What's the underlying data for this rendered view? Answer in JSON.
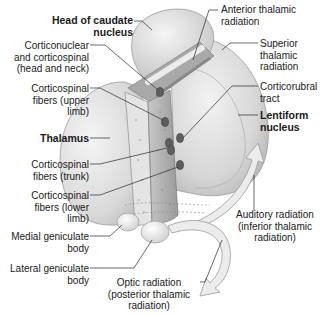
{
  "figure": {
    "labels": {
      "head_of_caudate": [
        "Head of caudate",
        "nucleus"
      ],
      "corticonuclear": [
        "Corticonuclear",
        "and corticospinal",
        "(head and neck)"
      ],
      "corticospinal_upper": [
        "Corticospinal",
        "fibers (upper",
        "limb)"
      ],
      "thalamus": [
        "Thalamus"
      ],
      "corticospinal_trunk": [
        "Corticospinal",
        "fibers (trunk)"
      ],
      "corticospinal_lower": [
        "Corticospinal",
        "fibers (lower",
        "limb)"
      ],
      "medial_geniculate": [
        "Medial geniculate",
        "body"
      ],
      "lateral_geniculate": [
        "Lateral geniculate",
        "body"
      ],
      "anterior_thalamic": [
        "Anterior thalamic",
        "radiation"
      ],
      "superior_thalamic": [
        "Superior",
        "thalamic",
        "radiation"
      ],
      "corticorubral": [
        "Corticorubral",
        "tract"
      ],
      "lentiform": [
        "Lentiform",
        "nucleus"
      ],
      "auditory_radiation": [
        "Auditory radiation",
        "(inferior thalamic",
        "radiation)"
      ],
      "optic_radiation": [
        "Optic radiation",
        "(posterior thalamic",
        "radiation)"
      ]
    }
  }
}
